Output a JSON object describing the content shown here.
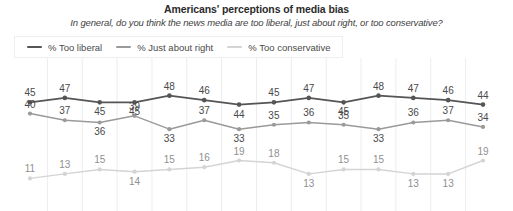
{
  "header": {
    "title": "Americans' perceptions of media bias",
    "subtitle": "In general, do you think the news media are too liberal, just about right, or too conservative?"
  },
  "legend": {
    "position": "top-left",
    "items": [
      {
        "label": "% Too liberal",
        "color": "#555555",
        "icon": "line-swatch"
      },
      {
        "label": "% Just about right",
        "color": "#9a9a9a",
        "icon": "line-swatch"
      },
      {
        "label": "% Too conservative",
        "color": "#d4d4d4",
        "icon": "line-swatch"
      }
    ]
  },
  "chart_data": {
    "type": "line",
    "title": "Americans' perceptions of media bias",
    "subtitle": "In general, do you think the news media are too liberal, just about right, or too conservative?",
    "xlabel": "",
    "ylabel": "",
    "ylim": [
      0,
      55
    ],
    "grid": "vertical-only",
    "legend_position": "top-left",
    "show_point_labels": true,
    "x": [
      1,
      2,
      3,
      4,
      5,
      6,
      7,
      8,
      9,
      10,
      11,
      12,
      13,
      14
    ],
    "categories": [
      "",
      "",
      "",
      "",
      "",
      "",
      "",
      "",
      "",
      "",
      "",
      "",
      "",
      ""
    ],
    "series": [
      {
        "name": "% Too liberal",
        "color": "#555555",
        "values": [
          45,
          47,
          45,
          45,
          48,
          46,
          44,
          45,
          47,
          45,
          48,
          47,
          46,
          44
        ]
      },
      {
        "name": "% Just about right",
        "color": "#9a9a9a",
        "values": [
          40,
          37,
          36,
          39,
          33,
          37,
          33,
          35,
          36,
          35,
          33,
          36,
          37,
          34
        ]
      },
      {
        "name": "% Too conservative",
        "color": "#d4d4d4",
        "values": [
          11,
          13,
          15,
          14,
          15,
          16,
          19,
          18,
          13,
          15,
          15,
          13,
          13,
          19
        ]
      }
    ]
  },
  "colors": {
    "background": "#ffffff",
    "gridline": "#ededed",
    "label_text": "#4a4a4a",
    "title_text": "#2b2b2b"
  }
}
